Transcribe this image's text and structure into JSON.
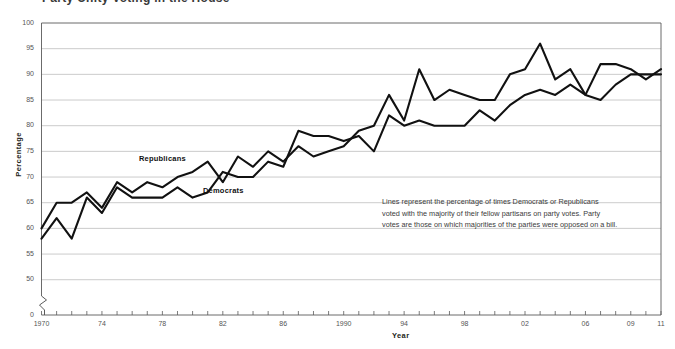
{
  "page": {
    "cut_off_title": "Party Unity Voting in the House",
    "background": "#ffffff",
    "ink": "#111111"
  },
  "axes": {
    "y_title": "Percentage",
    "x_title": "Year",
    "y_ticks": [
      "0",
      "50",
      "55",
      "60",
      "65",
      "70",
      "75",
      "80",
      "85",
      "90",
      "95",
      "100"
    ],
    "y_min": 48,
    "y_max": 100,
    "y_break_at_zero": true,
    "x_ticks": [
      "1970",
      "74",
      "78",
      "82",
      "86",
      "1990",
      "94",
      "98",
      "02",
      "06",
      "09",
      "11"
    ],
    "gridlines": true,
    "gridline_color": "#b5b5b5"
  },
  "annotation": {
    "text": "Lines represent the percentage of times Democrats or Republicans voted with the majority of their fellow partisans on party votes. Party votes are those on which majorities of the parties were opposed on a bill."
  },
  "series_labels": {
    "republicans": "Republicans",
    "democrats": "Democrats"
  },
  "chart_data": {
    "type": "line",
    "title": "Party Unity Voting in the House",
    "xlabel": "Year",
    "ylabel": "Percentage",
    "ylim": [
      48,
      100
    ],
    "xlim": [
      1970,
      2011
    ],
    "grid": true,
    "legend": "inline-labels",
    "x": [
      1970,
      1971,
      1972,
      1973,
      1974,
      1975,
      1976,
      1977,
      1978,
      1979,
      1980,
      1981,
      1982,
      1983,
      1984,
      1985,
      1986,
      1987,
      1988,
      1989,
      1990,
      1991,
      1992,
      1993,
      1994,
      1995,
      1996,
      1997,
      1998,
      1999,
      2000,
      2001,
      2002,
      2003,
      2004,
      2005,
      2006,
      2007,
      2008,
      2009,
      2010,
      2011
    ],
    "series": [
      {
        "name": "Democrats",
        "color": "#111111",
        "values": [
          58,
          62,
          58,
          66,
          63,
          68,
          66,
          66,
          66,
          68,
          66,
          67,
          71,
          70,
          70,
          73,
          72,
          79,
          78,
          78,
          77,
          78,
          75,
          82,
          80,
          81,
          80,
          80,
          80,
          83,
          81,
          84,
          86,
          87,
          86,
          88,
          86,
          92,
          92,
          91,
          89,
          91
        ],
        "label_position": {
          "x": 2.3,
          "y": 68
        }
      },
      {
        "name": "Republicans",
        "color": "#111111",
        "values": [
          60,
          65,
          65,
          67,
          64,
          69,
          67,
          69,
          68,
          70,
          71,
          73,
          69,
          74,
          72,
          75,
          73,
          76,
          74,
          75,
          76,
          79,
          80,
          86,
          81,
          91,
          85,
          87,
          86,
          85,
          85,
          90,
          91,
          96,
          89,
          91,
          86,
          85,
          88,
          90,
          90,
          90
        ],
        "label_position": {
          "x": 1.4,
          "y": 73
        }
      }
    ]
  }
}
